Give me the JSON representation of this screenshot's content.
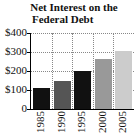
{
  "chart_data": {
    "type": "bar",
    "title": "Net Interest on the Federal Debt",
    "title_lines": [
      "Net Interest on the",
      "Federal Debt"
    ],
    "xlabel": "",
    "ylabel": "",
    "categories": [
      "1985",
      "1990",
      "1995",
      "2000",
      "2005"
    ],
    "values": [
      110,
      150,
      200,
      265,
      305
    ],
    "ylim": [
      0,
      400
    ],
    "yticks": [
      "0",
      "$100",
      "$200",
      "$300",
      "$400"
    ],
    "grid": true,
    "bar_colors": [
      "#111111",
      "#555555",
      "#111111",
      "#999999",
      "#cccccc"
    ]
  }
}
